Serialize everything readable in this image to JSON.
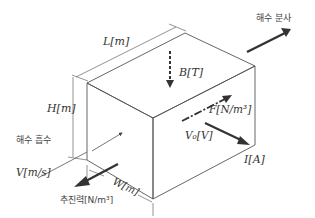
{
  "diagram": {
    "labels": {
      "length": "L[m]",
      "height": "H[m]",
      "width": "W[m]",
      "magnetic_field": "B[T]",
      "force_density": "F[N/m³]",
      "voltage": "V₀[V]",
      "current": "I[A]",
      "velocity": "V[m/s]",
      "seawater_intake": "해수 흡수",
      "seawater_jet": "해수 분사",
      "thrust": "추진력[N/m³]"
    },
    "colors": {
      "line": "#555555",
      "arrow": "#333333",
      "text": "#333333"
    }
  }
}
